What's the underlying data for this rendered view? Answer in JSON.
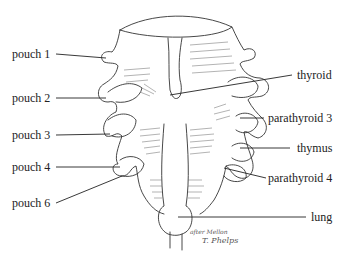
{
  "diagram": {
    "labels_left": [
      {
        "id": "pouch-1",
        "text": "pouch 1"
      },
      {
        "id": "pouch-2",
        "text": "pouch 2"
      },
      {
        "id": "pouch-3",
        "text": "pouch 3"
      },
      {
        "id": "pouch-4",
        "text": "pouch 4"
      },
      {
        "id": "pouch-6",
        "text": "pouch 6"
      }
    ],
    "labels_right": [
      {
        "id": "thyroid",
        "text": "thyroid"
      },
      {
        "id": "parathyroid-3",
        "text": "parathyroid 3"
      },
      {
        "id": "thymus",
        "text": "thymus"
      },
      {
        "id": "parathyroid-4",
        "text": "parathyroid 4"
      },
      {
        "id": "lung",
        "text": "lung"
      }
    ],
    "signature": {
      "line1": "after Mellon",
      "line2": "T. Phelps"
    },
    "colors": {
      "ink": "#222222",
      "hatch": "#555555",
      "background": "#ffffff"
    }
  }
}
